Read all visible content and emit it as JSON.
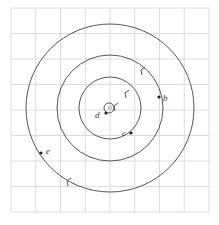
{
  "diagram": {
    "type": "concentric-orbits",
    "grid": {
      "x0": 11,
      "y0": 8,
      "x1": 209,
      "y1": 212,
      "cols": 8,
      "rows": 8,
      "color": "#dcdcdc"
    },
    "center": {
      "x": 110,
      "y": 108
    },
    "circles": [
      {
        "name": "outer-orbit",
        "r": 84
      },
      {
        "name": "middle-orbit",
        "r": 53
      },
      {
        "name": "inner-orbit",
        "r": 31
      },
      {
        "name": "center-loop",
        "r": 5
      }
    ],
    "stroke_color": "#555555",
    "points": [
      {
        "label": "b",
        "x": 159,
        "y": 97,
        "lx": 163,
        "ly": 101
      },
      {
        "label": "c",
        "x": 131,
        "y": 133,
        "lx": 122,
        "ly": 136
      },
      {
        "label": "d",
        "x": 106,
        "y": 113,
        "lx": 95,
        "ly": 118
      },
      {
        "label": "e",
        "x": 41,
        "y": 153,
        "lx": 46,
        "ly": 154
      }
    ],
    "arrows": [
      {
        "name": "arrow-middle",
        "x": 141,
        "y": 70
      },
      {
        "name": "arrow-inner",
        "x": 125,
        "y": 93
      },
      {
        "name": "arrow-outer",
        "x": 67,
        "y": 181
      },
      {
        "name": "arrow-center",
        "x": 114,
        "y": 106
      }
    ]
  }
}
